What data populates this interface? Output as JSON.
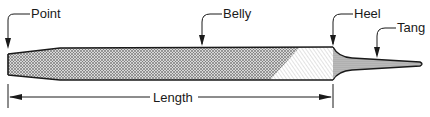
{
  "diagram": {
    "labels": {
      "point": "Point",
      "belly": "Belly",
      "heel": "Heel",
      "tang": "Tang",
      "length": "Length"
    },
    "colors": {
      "stroke": "#1a1a1a",
      "fill_crosshatch": "#9a9a9a",
      "background": "#ffffff"
    }
  }
}
